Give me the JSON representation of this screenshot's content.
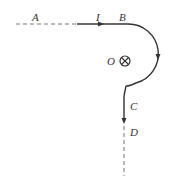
{
  "diagram": {
    "type": "physics-current-path",
    "labels": {
      "A": "A",
      "I": "I",
      "B": "B",
      "O": "O",
      "C": "C",
      "D": "D"
    },
    "field_symbol": "into-page (⊗)",
    "colors": {
      "line": "#333333",
      "dashed": "#777777",
      "background": "#ffffff"
    }
  }
}
